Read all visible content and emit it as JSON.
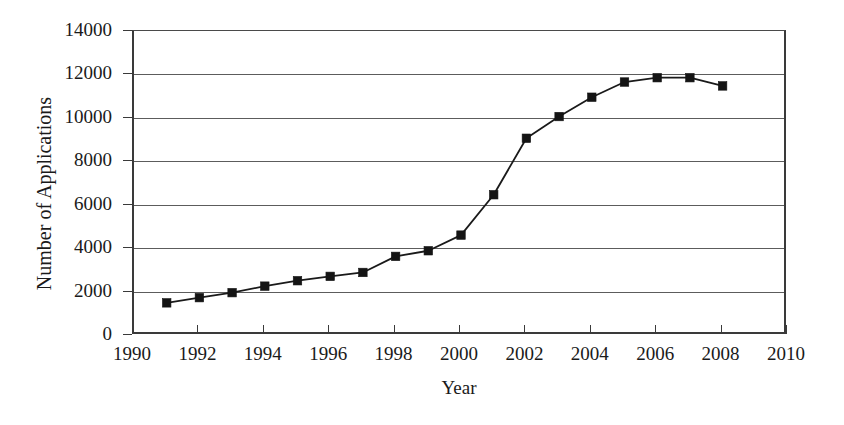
{
  "chart_data": {
    "type": "line",
    "title": "",
    "xlabel": "Year",
    "ylabel": "Number of Applications",
    "xlim": [
      1990,
      2010
    ],
    "ylim": [
      0,
      14000
    ],
    "xticks": [
      1990,
      1992,
      1994,
      1996,
      1998,
      2000,
      2002,
      2004,
      2006,
      2008,
      2010
    ],
    "xtick_labels": [
      "1990",
      "1992",
      "1994",
      "1996",
      "1998",
      "2000",
      "2002",
      "2004",
      "2006",
      "2008",
      "2010"
    ],
    "yticks": [
      0,
      2000,
      4000,
      6000,
      8000,
      10000,
      12000,
      14000
    ],
    "ytick_labels": [
      "0",
      "2000",
      "4000",
      "6000",
      "8000",
      "10000",
      "12000",
      "14000"
    ],
    "grid": "horizontal",
    "legend": "none",
    "marker": "filled-square",
    "line_color": "#1a1a1a",
    "marker_color": "#141414",
    "x": [
      1991,
      1992,
      1993,
      1994,
      1995,
      1996,
      1997,
      1998,
      1999,
      2000,
      2001,
      2002,
      2003,
      2004,
      2005,
      2006,
      2007,
      2008
    ],
    "values": [
      1480,
      1720,
      1950,
      2250,
      2500,
      2700,
      2880,
      3620,
      3880,
      4600,
      6460,
      9060,
      10060,
      10950,
      11650,
      11850,
      11850,
      11470
    ],
    "series": [
      {
        "name": "Number of Applications",
        "x": [
          1991,
          1992,
          1993,
          1994,
          1995,
          1996,
          1997,
          1998,
          1999,
          2000,
          2001,
          2002,
          2003,
          2004,
          2005,
          2006,
          2007,
          2008
        ],
        "values": [
          1480,
          1720,
          1950,
          2250,
          2500,
          2700,
          2880,
          3620,
          3880,
          4600,
          6460,
          9060,
          10060,
          10950,
          11650,
          11850,
          11850,
          11470
        ]
      }
    ]
  }
}
